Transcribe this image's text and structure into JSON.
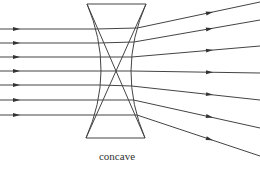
{
  "figure": {
    "caption": "concave",
    "type": "optics-ray-diagram",
    "colors": {
      "line": "#444444",
      "background": "#ffffff",
      "text": "#333333"
    }
  },
  "lens": {
    "kind": "concave",
    "top_edge": {
      "x1": 87,
      "y1": 4,
      "x2": 146,
      "y2": 4
    },
    "bottom_edge": {
      "x1": 86,
      "y1": 138,
      "x2": 145,
      "y2": 138
    },
    "left_surface": {
      "x_top": 87,
      "x_mid": 101,
      "x_bottom": 86
    },
    "right_surface": {
      "x_top": 146,
      "x_mid": 131,
      "x_bottom": 145
    },
    "internal_cross_lines": [
      {
        "x1": 87,
        "y1": 4,
        "x2": 145,
        "y2": 138
      },
      {
        "x1": 146,
        "y1": 4,
        "x2": 86,
        "y2": 138
      }
    ]
  },
  "rays": {
    "incoming_y": [
      29,
      43,
      57,
      71,
      85,
      100,
      115
    ],
    "outgoing": [
      {
        "y_lens": 28,
        "y_end": 2
      },
      {
        "y_lens": 42,
        "y_end": 20
      },
      {
        "y_lens": 57,
        "y_end": 46
      },
      {
        "y_lens": 71,
        "y_end": 73
      },
      {
        "y_lens": 86,
        "y_end": 100
      },
      {
        "y_lens": 100,
        "y_end": 128
      },
      {
        "y_lens": 115,
        "y_end": 156
      }
    ]
  }
}
